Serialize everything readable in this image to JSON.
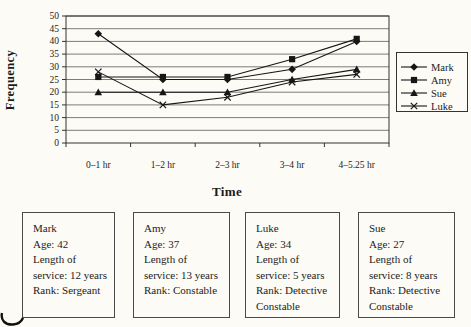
{
  "chart_data": {
    "type": "line",
    "title": "",
    "xlabel": "Time",
    "ylabel": "Frequency",
    "categories": [
      "0–1 hr",
      "1–2 hr",
      "2–3 hr",
      "3–4 hr",
      "4–5.25 hr"
    ],
    "series": [
      {
        "name": "Mark",
        "marker": "diamond",
        "values": [
          43,
          25,
          25,
          29,
          40
        ]
      },
      {
        "name": "Amy",
        "marker": "square",
        "values": [
          26,
          26,
          26,
          33,
          41
        ]
      },
      {
        "name": "Sue",
        "marker": "triangle",
        "values": [
          20,
          20,
          20,
          25,
          29
        ]
      },
      {
        "name": "Luke",
        "marker": "x",
        "values": [
          28,
          15,
          18,
          24,
          27
        ]
      }
    ],
    "ylim": [
      0,
      50
    ],
    "ytick_step": 5,
    "grid": true,
    "legend_position": "right",
    "line_color": "#161616"
  },
  "profiles": [
    {
      "name": "Mark",
      "age": "42",
      "length_of_service": "12 years",
      "rank": "Sergeant",
      "lines": [
        "Mark",
        "Age: 42",
        "Length of",
        "service: 12 years",
        "Rank: Sergeant"
      ]
    },
    {
      "name": "Amy",
      "age": "37",
      "length_of_service": "13 years",
      "rank": "Constable",
      "lines": [
        "Amy",
        "Age: 37",
        "Length of",
        "service: 13 years",
        "Rank: Constable"
      ]
    },
    {
      "name": "Luke",
      "age": "34",
      "length_of_service": "5 years",
      "rank": "Detective Constable",
      "lines": [
        "Luke",
        "Age: 34",
        "Length of",
        "service: 5 years",
        "Rank: Detective",
        "Constable"
      ]
    },
    {
      "name": "Sue",
      "age": "27",
      "length_of_service": "8 years",
      "rank": "Detective Constable",
      "lines": [
        "Sue",
        "Age: 27",
        "Length of",
        "service: 8 years",
        "Rank: Detective",
        "Constable"
      ]
    }
  ]
}
